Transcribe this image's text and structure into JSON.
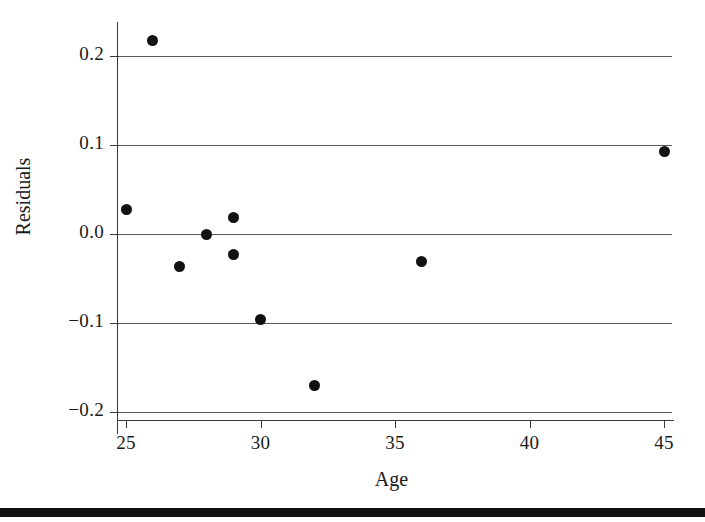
{
  "chart_data": {
    "type": "scatter",
    "title": "",
    "xlabel": "Age",
    "ylabel": "Residuals",
    "xlim": [
      23.2,
      45.7
    ],
    "ylim": [
      -0.223,
      0.244
    ],
    "grid": "horizontal",
    "legend": "none",
    "marker": {
      "shape": "circle",
      "color": "#111111",
      "size": 11
    },
    "xticks": [
      25,
      30,
      35,
      40,
      45
    ],
    "xtick_labels": [
      "25",
      "30",
      "35",
      "40",
      "45"
    ],
    "yticks": [
      -0.2,
      -0.1,
      0.0,
      0.1,
      0.2
    ],
    "ytick_labels": [
      "−0.2",
      "−0.1",
      "0.0",
      "0.1",
      "0.2"
    ],
    "gridline_values": [
      0.2,
      0.1,
      0.0,
      -0.1,
      -0.2
    ],
    "x": [
      25,
      26,
      27,
      28,
      29,
      29,
      30,
      32,
      36,
      45
    ],
    "y": [
      0.028,
      0.217,
      -0.036,
      0.0,
      0.018,
      -0.023,
      -0.096,
      -0.17,
      -0.031,
      0.093
    ],
    "points": [
      {
        "x": 25,
        "y": 0.028
      },
      {
        "x": 26,
        "y": 0.217
      },
      {
        "x": 27,
        "y": -0.036
      },
      {
        "x": 28,
        "y": 0.0
      },
      {
        "x": 29,
        "y": 0.018
      },
      {
        "x": 29,
        "y": -0.023
      },
      {
        "x": 30,
        "y": -0.096
      },
      {
        "x": 32,
        "y": -0.17
      },
      {
        "x": 36,
        "y": -0.031
      },
      {
        "x": 45,
        "y": 0.093
      }
    ],
    "colors": {
      "marker": "#111111",
      "gridline": "#5a5a5a",
      "axis": "#3a3a3a",
      "text": "#1a1a1a",
      "background": "#ffffff",
      "footer_bar": "#111111"
    }
  }
}
